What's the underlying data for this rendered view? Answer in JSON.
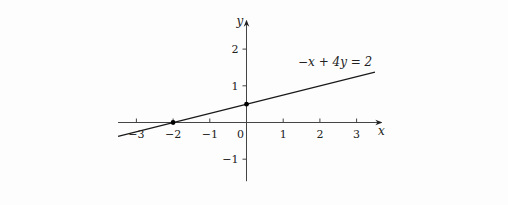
{
  "chart_data": {
    "type": "line",
    "title": "",
    "xlabel": "x",
    "ylabel": "y",
    "xlim": [
      -3.5,
      3.5
    ],
    "ylim": [
      -1.6,
      2.6
    ],
    "grid": false,
    "x_ticks": [
      -3,
      -2,
      -1,
      0,
      1,
      2,
      3
    ],
    "x_tick_labels": [
      "−3",
      "−2",
      "−1",
      "0",
      "1",
      "2",
      "3"
    ],
    "y_ticks": [
      -1,
      1,
      2
    ],
    "y_tick_labels": [
      "−1",
      "1",
      "2"
    ],
    "series": [
      {
        "name": "−x + 4y = 2",
        "equation": "-x + 4y = 2",
        "x": [
          -3.5,
          3.5
        ],
        "y": [
          -0.375,
          1.375
        ]
      }
    ],
    "points": [
      {
        "x": -2,
        "y": 0,
        "label": "x-intercept"
      },
      {
        "x": 0,
        "y": 0.5,
        "label": "y-intercept"
      }
    ],
    "annotations": [
      {
        "text": "−x + 4y = 2",
        "near": "line upper-right"
      }
    ],
    "colors": {
      "line": "#1a1a1a",
      "axis": "#444444",
      "point": "#000000"
    }
  }
}
